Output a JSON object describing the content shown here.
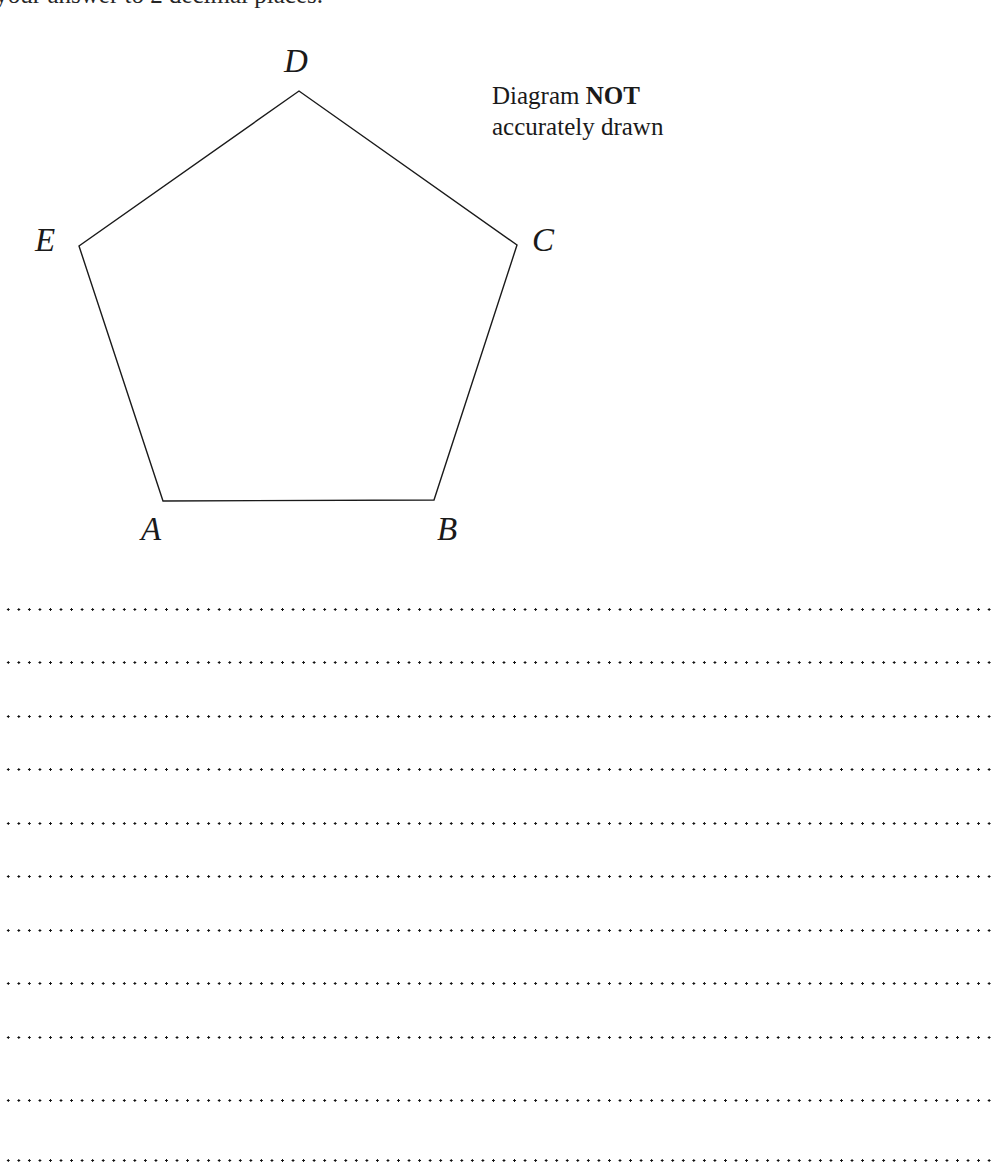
{
  "page": {
    "width": 994,
    "height": 1173,
    "background_color": "#ffffff",
    "ink_color": "#1a1a1a"
  },
  "instruction": {
    "text": "e your answer to 2 decimal places.",
    "full_visible_fragment": "e your answer to 2 decimal places.",
    "note": "top line is cropped by the page edge"
  },
  "diagram_note": {
    "line1_prefix": "Diagram ",
    "line1_emphasis": "NOT",
    "line2": "accurately drawn"
  },
  "figure": {
    "shape": "pentagon",
    "name": "ABCDE",
    "stroke_color": "#1a1a1a",
    "stroke_width": 1.4,
    "fill": "none",
    "vertices": [
      {
        "label": "A",
        "x": 163,
        "y": 501
      },
      {
        "label": "B",
        "x": 434,
        "y": 500
      },
      {
        "label": "C",
        "x": 517,
        "y": 245
      },
      {
        "label": "D",
        "x": 299,
        "y": 91
      },
      {
        "label": "E",
        "x": 79,
        "y": 246
      }
    ],
    "vertex_labels": [
      {
        "text": "D",
        "x": 284,
        "y": 45
      },
      {
        "text": "E",
        "x": 35,
        "y": 224
      },
      {
        "text": "C",
        "x": 532,
        "y": 224
      },
      {
        "text": "A",
        "x": 141,
        "y": 513
      },
      {
        "text": "B",
        "x": 437,
        "y": 513
      }
    ]
  },
  "answer_lines": {
    "count": 11,
    "style": "dotted",
    "left": 3,
    "right": 992,
    "y_positions": [
      609,
      662,
      716,
      769,
      823,
      876,
      930,
      983,
      1037,
      1100,
      1160
    ]
  }
}
